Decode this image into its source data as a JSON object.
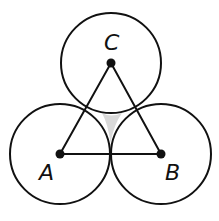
{
  "diagram": {
    "points": {
      "A": {
        "label": "A",
        "x": 60,
        "y": 154
      },
      "B": {
        "label": "B",
        "x": 161,
        "y": 154
      },
      "C": {
        "label": "C",
        "x": 111,
        "y": 63
      }
    },
    "circle_radius": 50,
    "colors": {
      "stroke": "#111111",
      "shade": "#d9d9d9",
      "background": "#ffffff"
    }
  }
}
